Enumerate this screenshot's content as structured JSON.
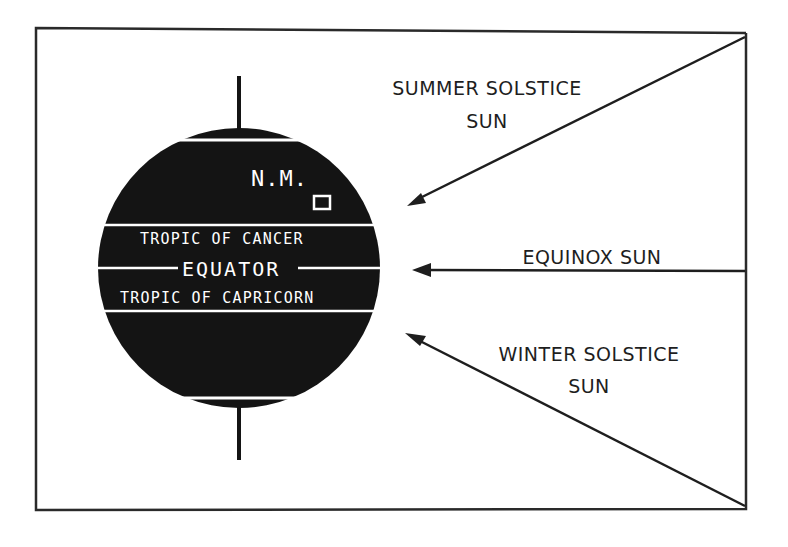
{
  "diagram": {
    "globe": {
      "label_nm": "N.M.",
      "label_cancer": "TROPIC OF CANCER",
      "label_equator": "EQUATOR",
      "label_capricorn": "TROPIC OF CAPRICORN",
      "fill_color": "#141414",
      "line_color": "#ffffff"
    },
    "arrows": [
      {
        "id": "summer",
        "label_line1": "SUMMER SOLSTICE",
        "label_line2": "SUN"
      },
      {
        "id": "equinox",
        "label_line1": "EQUINOX SUN"
      },
      {
        "id": "winter",
        "label_line1": "WINTER SOLSTICE",
        "label_line2": "SUN"
      }
    ],
    "ink_color": "#1e1e1e"
  }
}
